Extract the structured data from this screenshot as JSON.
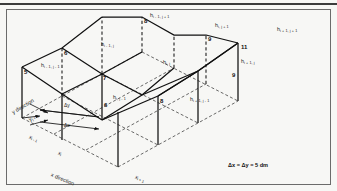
{
  "figure": {
    "type": "isometric-grid-diagram",
    "caption": "Δx = Δy = 5 dm",
    "axes": {
      "y_label": "y direction",
      "x_label": "x direction",
      "delta_y": "Δy",
      "delta_x": "Δx",
      "ticks": [
        {
          "id": "y_jp1",
          "base": "y",
          "sub": "j + 1"
        },
        {
          "id": "x_im1",
          "base": "x",
          "sub": "i - 1"
        },
        {
          "id": "x_i",
          "base": "x",
          "sub": "i"
        },
        {
          "id": "x_ip1",
          "base": "x",
          "sub": "i + 1"
        }
      ]
    },
    "heads": [
      {
        "id": "h_im1_jp1",
        "base": "h",
        "sub": "i - 1, j + 1",
        "value": "8"
      },
      {
        "id": "h_i_jp1",
        "base": "h",
        "sub": "i, j + 1",
        "value": "9"
      },
      {
        "id": "h_ip1_jp1",
        "base": "h",
        "sub": "i + 1, j + 1",
        "value": "11"
      },
      {
        "id": "h_im1_j",
        "base": "h",
        "sub": "i - 1, j",
        "value": "6"
      },
      {
        "id": "h_i_j",
        "base": "h",
        "sub": "i, j",
        "value": "7"
      },
      {
        "id": "h_ip1_j",
        "base": "h",
        "sub": "i + 1, j",
        "value": "9"
      },
      {
        "id": "h_im1_jm1",
        "base": "h",
        "sub": "i - 1, j - 1",
        "value": "5"
      },
      {
        "id": "h_i_jm1",
        "base": "h",
        "sub": "i, j - 1",
        "value": "6"
      },
      {
        "id": "h_ip1_jm1",
        "base": "h",
        "sub": "i + 1, j - 1",
        "value": "8"
      }
    ],
    "colors": {
      "background": "#f7f7f5",
      "line": "#111111",
      "dashed": "#2a2a2a",
      "frame": "#6b6b6b",
      "rule": "#3c3c3c"
    }
  }
}
